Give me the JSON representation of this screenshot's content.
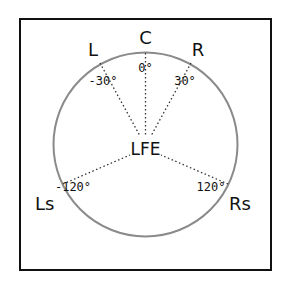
{
  "diagram": {
    "type": "surround-speaker-layout",
    "colors": {
      "frame": "#111111",
      "circle": "#8a8a8a",
      "lines": "#333333",
      "text": "#111111"
    },
    "center_label": "LFE",
    "speakers": [
      {
        "id": "C",
        "label": "C",
        "angle_label": "0°"
      },
      {
        "id": "L",
        "label": "L",
        "angle_label": "-30°"
      },
      {
        "id": "R",
        "label": "R",
        "angle_label": "30°"
      },
      {
        "id": "Ls",
        "label": "Ls",
        "angle_label": "-120°"
      },
      {
        "id": "Rs",
        "label": "Rs",
        "angle_label": "120°"
      }
    ]
  }
}
